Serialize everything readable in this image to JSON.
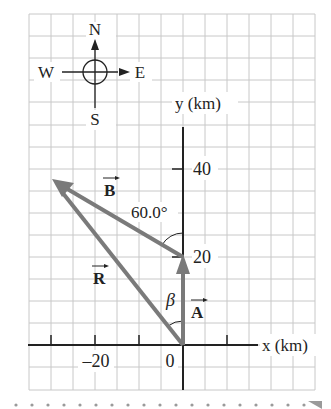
{
  "compass": {
    "north": "N",
    "south": "S",
    "east": "E",
    "west": "W"
  },
  "axes": {
    "x_label": "x (km)",
    "y_label": "y (km)",
    "x_ticks": [
      {
        "value": -30,
        "label": ""
      },
      {
        "value": -20,
        "label": "–20"
      },
      {
        "value": -10,
        "label": ""
      },
      {
        "value": 0,
        "label": "0"
      },
      {
        "value": 10,
        "label": ""
      }
    ],
    "y_ticks": [
      {
        "value": 20,
        "label": "20"
      },
      {
        "value": 40,
        "label": "40"
      }
    ]
  },
  "vectors": {
    "A": {
      "label": "A",
      "from": [
        0,
        0
      ],
      "to": [
        0,
        20
      ]
    },
    "B": {
      "label": "B",
      "from": [
        0,
        20
      ],
      "to": [
        -30,
        37.5
      ]
    },
    "R": {
      "label": "R",
      "from": [
        0,
        0
      ],
      "to": [
        -30,
        37.5
      ]
    }
  },
  "angles": {
    "B_angle": "60.0°",
    "R_angle": "β"
  },
  "colors": {
    "grid": "#c8c8c8",
    "axis": "#222222",
    "vector": "#7a7a7a"
  }
}
